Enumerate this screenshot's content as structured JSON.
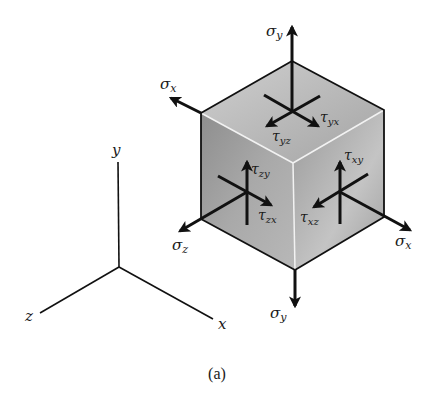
{
  "figure": {
    "caption": "(a)",
    "colors": {
      "ink": "#111111",
      "face_top_light": "#d4d4d4",
      "face_top_dark": "#a9a9a9",
      "face_left_light": "#a8a8a8",
      "face_left_dark": "#6f6f6f",
      "face_right_light": "#c9c9c9",
      "face_right_dark": "#8c8c8c",
      "edge_highlight": "#f4f4f4"
    },
    "axes": {
      "x_label": "x",
      "y_label": "y",
      "z_label": "z"
    },
    "labels": {
      "sigma_y_top": "σ",
      "sigma_y_top_sub": "y",
      "sigma_y_bottom": "σ",
      "sigma_y_bottom_sub": "y",
      "sigma_x_left": "σ",
      "sigma_x_left_sub": "x",
      "sigma_x_right": "σ",
      "sigma_x_right_sub": "x",
      "sigma_z": "σ",
      "sigma_z_sub": "z",
      "tau_yx": "τ",
      "tau_yx_sub": "yx",
      "tau_yz": "τ",
      "tau_yz_sub": "yz",
      "tau_zy": "τ",
      "tau_zy_sub": "zy",
      "tau_zx": "τ",
      "tau_zx_sub": "zx",
      "tau_xy": "τ",
      "tau_xy_sub": "xy",
      "tau_xz": "τ",
      "tau_xz_sub": "xz"
    }
  }
}
